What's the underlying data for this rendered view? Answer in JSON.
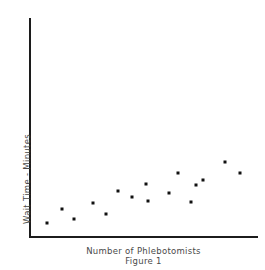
{
  "chart_data": {
    "type": "scatter",
    "title": "",
    "caption": "Figure 1",
    "xlabel": "Number of Phlebotomists",
    "ylabel": "Wait Time - Minutes",
    "grid": false,
    "legend": false,
    "axis_ticks": false,
    "marker": {
      "shape": "square",
      "size_px": 3,
      "color": "#111111"
    },
    "axis_color": "#1c1c1c",
    "background_color": "#ffffff",
    "text_color": "#4a4a4a",
    "xlim": [
      0,
      16
    ],
    "ylim": [
      0,
      16
    ],
    "n_points": 16,
    "points": [
      {
        "x": 1.55,
        "y": 1.45
      },
      {
        "x": 2.55,
        "y": 3.25
      },
      {
        "x": 3.35,
        "y": 2.05
      },
      {
        "x": 4.65,
        "y": 4.05
      },
      {
        "x": 5.55,
        "y": 2.75
      },
      {
        "x": 6.35,
        "y": 5.65
      },
      {
        "x": 7.3,
        "y": 4.95
      },
      {
        "x": 8.25,
        "y": 6.55
      },
      {
        "x": 8.35,
        "y": 4.35
      },
      {
        "x": 9.75,
        "y": 5.55
      },
      {
        "x": 10.35,
        "y": 8.05
      },
      {
        "x": 11.25,
        "y": 4.25
      },
      {
        "x": 11.6,
        "y": 6.45
      },
      {
        "x": 12.05,
        "y": 7.05
      },
      {
        "x": 13.55,
        "y": 9.25
      },
      {
        "x": 14.55,
        "y": 8.15
      }
    ],
    "pixel_points": [
      {
        "px": 47,
        "py": 223
      },
      {
        "px": 62,
        "py": 209
      },
      {
        "px": 74,
        "py": 219
      },
      {
        "px": 93,
        "py": 203
      },
      {
        "px": 106,
        "py": 214
      },
      {
        "px": 118,
        "py": 191
      },
      {
        "px": 132,
        "py": 197
      },
      {
        "px": 146,
        "py": 184
      },
      {
        "px": 148,
        "py": 201
      },
      {
        "px": 169,
        "py": 193
      },
      {
        "px": 178,
        "py": 173
      },
      {
        "px": 191,
        "py": 202
      },
      {
        "px": 196,
        "py": 185
      },
      {
        "px": 203,
        "py": 180
      },
      {
        "px": 225,
        "py": 162
      },
      {
        "px": 240,
        "py": 173
      }
    ]
  }
}
